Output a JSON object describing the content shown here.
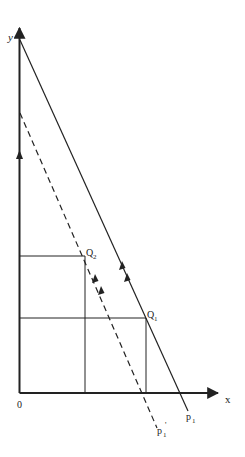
{
  "diagram": {
    "axes": {
      "x_label": "x",
      "y_label": "y",
      "origin_label": "0"
    },
    "points": {
      "q1": {
        "label": "Q",
        "sub": "1"
      },
      "q2": {
        "label": "Q",
        "sub": "2"
      }
    },
    "lines": {
      "p1": {
        "label": "p",
        "sub": "1",
        "style": "solid"
      },
      "p1_prime": {
        "label": "p",
        "sub": "1",
        "prime": "'",
        "style": "dashed"
      }
    },
    "colors": {
      "ink": "#222222",
      "background": "#ffffff"
    }
  }
}
